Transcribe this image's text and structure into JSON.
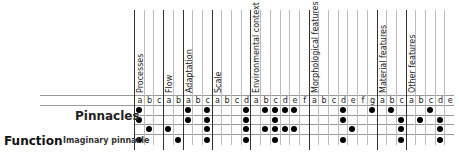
{
  "table": {
    "row_heading": "Pinnacles",
    "section_heading": "Function",
    "sub_row_label": "Imaginary pinnacle",
    "groups": [
      {
        "name": "Processes",
        "letters": [
          "a",
          "b",
          "c"
        ]
      },
      {
        "name": "Flow",
        "letters": [
          "a",
          "b"
        ]
      },
      {
        "name": "Adaptation",
        "letters": [
          "a",
          "b",
          "c"
        ]
      },
      {
        "name": "Scale",
        "letters": [
          "a",
          "b",
          "c",
          "d"
        ]
      },
      {
        "name": "Environmental context",
        "letters": [
          "a",
          "b",
          "c",
          "d",
          "e",
          "f"
        ]
      },
      {
        "name": "Morphological features",
        "letters": [
          "a",
          "b",
          "c",
          "d",
          "e",
          "f",
          "g"
        ]
      },
      {
        "name": "Material features",
        "letters": [
          "a",
          "b",
          "c"
        ]
      },
      {
        "name": "Other features",
        "letters": [
          "a",
          "b",
          "c",
          "d",
          "e"
        ]
      }
    ],
    "rows": [
      {
        "label": "",
        "dots": [
          0,
          5,
          7,
          11,
          13,
          14,
          15,
          16,
          21,
          24,
          26,
          30
        ]
      },
      {
        "label": "",
        "dots": [
          0,
          5,
          7,
          11,
          14,
          21,
          27,
          29,
          31
        ]
      },
      {
        "label": "",
        "dots": [
          1,
          3,
          7,
          11,
          13,
          14,
          15,
          16,
          22,
          27,
          31
        ]
      },
      {
        "label": "Imaginary pinnacle",
        "dots": [
          0,
          4,
          7,
          11,
          14,
          21,
          27,
          31
        ]
      }
    ]
  }
}
